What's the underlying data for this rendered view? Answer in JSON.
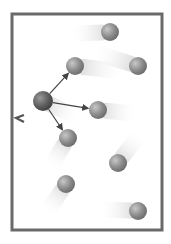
{
  "diagram": {
    "colors": {
      "background": "#ffffff",
      "container_wall": "#6a6a6a",
      "particle": "#8a8a8a",
      "highlighted_particle": "#5e5e5e",
      "trail": "#d8d8d8",
      "arrow": "#444444"
    },
    "particles": [
      {
        "id": "p1",
        "cx": 110,
        "cy": 32,
        "trail_dx": -40,
        "trail_dy": 2
      },
      {
        "id": "p2",
        "cx": 75,
        "cy": 66,
        "trail_dx": 50,
        "trail_dy": 6
      },
      {
        "id": "p3",
        "cx": 138,
        "cy": 66,
        "trail_dx": -45,
        "trail_dy": -14
      },
      {
        "id": "p4",
        "cx": 98,
        "cy": 110,
        "trail_dx": 40,
        "trail_dy": 4
      },
      {
        "id": "p5",
        "cx": 68,
        "cy": 138,
        "trail_dx": -18,
        "trail_dy": 30
      },
      {
        "id": "p6",
        "cx": 118,
        "cy": 163,
        "trail_dx": 22,
        "trail_dy": -30
      },
      {
        "id": "p7",
        "cx": 66,
        "cy": 184,
        "trail_dx": -20,
        "trail_dy": 30
      },
      {
        "id": "p8",
        "cx": 138,
        "cy": 211,
        "trail_dx": -40,
        "trail_dy": -2
      }
    ],
    "central_particle": {
      "id": "p0",
      "cx": 43,
      "cy": 101
    },
    "arrows": [
      {
        "to": "p2"
      },
      {
        "to": "p4"
      },
      {
        "to": "p5"
      },
      {
        "to": "wall"
      }
    ]
  }
}
